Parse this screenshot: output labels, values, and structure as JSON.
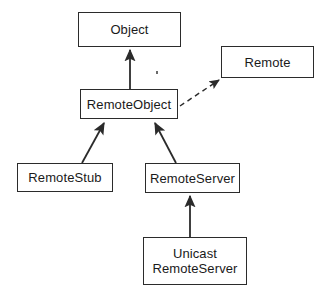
{
  "diagram": {
    "type": "uml-class-diagram",
    "background_color": "#ffffff",
    "line_color": "#2b2b2b",
    "text_color": "#1a1a1a",
    "nodes": [
      {
        "id": "object",
        "label": "Object",
        "kind": "class",
        "x": 78,
        "y": 12,
        "width": 103,
        "height": 35
      },
      {
        "id": "remote",
        "label": "Remote",
        "kind": "interface",
        "x": 221,
        "y": 46,
        "width": 93,
        "height": 32
      },
      {
        "id": "remote-object",
        "label": "RemoteObject",
        "kind": "class",
        "x": 80,
        "y": 89,
        "width": 98,
        "height": 30
      },
      {
        "id": "remote-stub",
        "label": "RemoteStub",
        "kind": "class",
        "x": 17,
        "y": 163,
        "width": 96,
        "height": 29
      },
      {
        "id": "remote-server",
        "label": "RemoteServer",
        "kind": "class",
        "x": 145,
        "y": 163,
        "width": 95,
        "height": 30
      },
      {
        "id": "unicast-remote-server",
        "label": "Unicast\nRemoteServer",
        "kind": "class",
        "x": 143,
        "y": 237,
        "width": 104,
        "height": 48
      }
    ],
    "edges": [
      {
        "id": "remote-object-to-object",
        "from": "remote-object",
        "to": "object",
        "relation": "inheritance",
        "style": "solid",
        "arrowhead": "filled-triangle"
      },
      {
        "id": "remote-object-to-remote",
        "from": "remote-object",
        "to": "remote",
        "relation": "realization",
        "style": "dashed",
        "arrowhead": "filled-triangle"
      },
      {
        "id": "remote-stub-to-remote-object",
        "from": "remote-stub",
        "to": "remote-object",
        "relation": "inheritance",
        "style": "solid",
        "arrowhead": "filled-triangle"
      },
      {
        "id": "remote-server-to-remote-object",
        "from": "remote-server",
        "to": "remote-object",
        "relation": "inheritance",
        "style": "solid",
        "arrowhead": "filled-triangle"
      },
      {
        "id": "unicast-remote-server-to-remote-server",
        "from": "unicast-remote-server",
        "to": "remote-server",
        "relation": "inheritance",
        "style": "solid",
        "arrowhead": "filled-triangle"
      }
    ]
  }
}
